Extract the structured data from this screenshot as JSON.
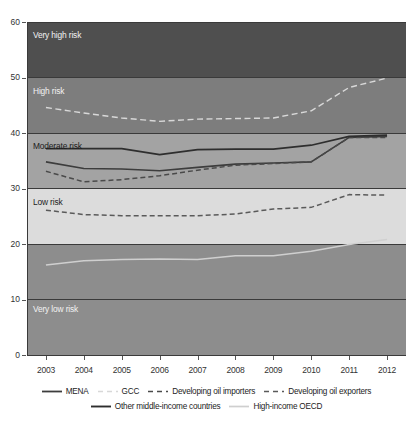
{
  "chart_data": {
    "type": "line",
    "title": "",
    "xlabel": "",
    "ylabel": "",
    "x": [
      2003,
      2004,
      2005,
      2006,
      2007,
      2008,
      2009,
      2010,
      2011,
      2012
    ],
    "xlim": [
      2002.5,
      2012.5
    ],
    "ylim": [
      0,
      60
    ],
    "yticks": [
      0,
      10,
      20,
      30,
      40,
      50,
      60
    ],
    "xticks": [
      "2003",
      "2004",
      "2005",
      "2006",
      "2007",
      "2008",
      "2009",
      "2010",
      "2011",
      "2012"
    ],
    "grid": true,
    "legend_position": "bottom",
    "series": [
      {
        "name": "MENA",
        "style": "solid",
        "color": "#3d3d3d",
        "width": 1.6,
        "values": [
          34.8,
          33.6,
          33.5,
          33.2,
          33.8,
          34.4,
          34.6,
          34.8,
          39.2,
          39.4
        ]
      },
      {
        "name": "GCC",
        "style": "dashed-long",
        "color": "#d8d8d8",
        "width": 1.4,
        "values": [
          44.6,
          43.6,
          42.7,
          42.1,
          42.5,
          42.6,
          42.7,
          44.0,
          48.2,
          49.9
        ]
      },
      {
        "name": "Developing oil importers",
        "style": "dashed",
        "color": "#4a4a4a",
        "width": 1.5,
        "values": [
          33.1,
          31.2,
          31.6,
          32.3,
          33.3,
          34.2,
          34.5,
          34.8,
          39.2,
          39.2
        ]
      },
      {
        "name": "Developing oil exporters",
        "style": "dashed",
        "color": "#5a5a5a",
        "width": 1.5,
        "values": [
          26.1,
          25.3,
          25.1,
          25.1,
          25.1,
          25.4,
          26.3,
          26.6,
          28.9,
          28.8
        ]
      },
      {
        "name": "Other middle-income countries",
        "style": "solid",
        "color": "#2e2e2e",
        "width": 1.7,
        "values": [
          37.2,
          37.2,
          37.2,
          36.1,
          37.0,
          37.1,
          37.1,
          37.8,
          39.4,
          39.6
        ]
      },
      {
        "name": "High-income OECD",
        "style": "solid",
        "color": "#cfcfcf",
        "width": 1.5,
        "values": [
          16.2,
          17.0,
          17.2,
          17.3,
          17.2,
          17.9,
          17.9,
          18.7,
          19.9,
          20.8
        ]
      }
    ],
    "bands": [
      {
        "label": "Very high risk",
        "from": 50,
        "to": 60,
        "color": "#4f4f4f",
        "text_color": "light"
      },
      {
        "label": "High risk",
        "from": 40,
        "to": 50,
        "color": "#7d7d7d",
        "text_color": "light"
      },
      {
        "label": "Moderate risk",
        "from": 30,
        "to": 40,
        "color": "#a3a3a3",
        "text_color": "dark"
      },
      {
        "label": "Low risk",
        "from": 20,
        "to": 30,
        "color": "#dcdcdc",
        "text_color": "dark"
      },
      {
        "label": "Very low risk",
        "from": 0,
        "to": 20,
        "color": "#8d8d8d",
        "text_color": "light"
      }
    ]
  },
  "legend": {
    "rows": [
      [
        {
          "label": "MENA",
          "series": 0
        },
        {
          "label": "GCC",
          "series": 1
        },
        {
          "label": "Developing oil importers",
          "series": 2
        },
        {
          "label": "Developing oil exporters",
          "series": 3
        }
      ],
      [
        {
          "label": "Other middle-income countries",
          "series": 4
        },
        {
          "label": "High-income OECD",
          "series": 5
        }
      ]
    ]
  }
}
